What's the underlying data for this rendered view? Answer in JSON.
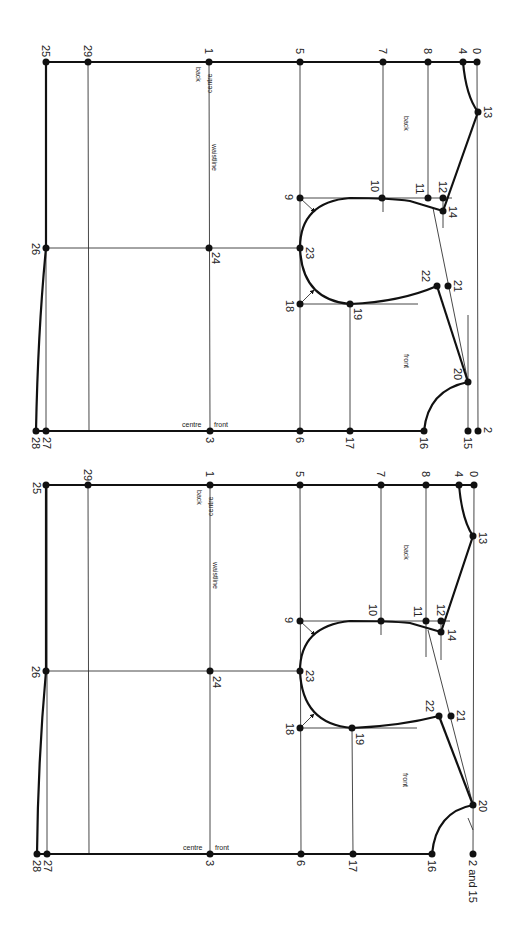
{
  "figure": {
    "panels": [
      {
        "id": "draft-1",
        "labels": {
          "back": "back",
          "front": "front",
          "waistline": "waistline",
          "centre_back": [
            "centre",
            "back"
          ],
          "centre_front": [
            "centre",
            "front"
          ]
        },
        "points": [
          {
            "n": "25",
            "x": 46,
            "y": 62
          },
          {
            "n": "29",
            "x": 88,
            "y": 62
          },
          {
            "n": "1",
            "x": 209,
            "y": 62
          },
          {
            "n": "5",
            "x": 300,
            "y": 62
          },
          {
            "n": "7",
            "x": 383,
            "y": 62
          },
          {
            "n": "8",
            "x": 428,
            "y": 62
          },
          {
            "n": "4",
            "x": 463,
            "y": 62
          },
          {
            "n": "0",
            "x": 477,
            "y": 62
          },
          {
            "n": "13",
            "x": 478,
            "y": 112
          },
          {
            "n": "9",
            "x": 300,
            "y": 198
          },
          {
            "n": "10",
            "x": 382,
            "y": 198
          },
          {
            "n": "11",
            "x": 428,
            "y": 198
          },
          {
            "n": "12",
            "x": 443,
            "y": 198
          },
          {
            "n": "14",
            "x": 443,
            "y": 211
          },
          {
            "n": "26",
            "x": 46,
            "y": 248
          },
          {
            "n": "24",
            "x": 209,
            "y": 248
          },
          {
            "n": "23",
            "x": 300,
            "y": 248
          },
          {
            "n": "22",
            "x": 437,
            "y": 286
          },
          {
            "n": "21",
            "x": 448,
            "y": 286
          },
          {
            "n": "18",
            "x": 300,
            "y": 304
          },
          {
            "n": "19",
            "x": 350,
            "y": 304
          },
          {
            "n": "20",
            "x": 468,
            "y": 382
          },
          {
            "n": "28",
            "x": 36,
            "y": 431
          },
          {
            "n": "27",
            "x": 46,
            "y": 431
          },
          {
            "n": "3",
            "x": 210,
            "y": 431
          },
          {
            "n": "6",
            "x": 300,
            "y": 431
          },
          {
            "n": "17",
            "x": 350,
            "y": 431
          },
          {
            "n": "16",
            "x": 424,
            "y": 431
          },
          {
            "n": "15",
            "x": 468,
            "y": 431
          },
          {
            "n": "2",
            "x": 478,
            "y": 431
          }
        ]
      },
      {
        "id": "draft-2",
        "labels": {
          "back": "back",
          "front": "front",
          "waistline": "waistline",
          "centre_back": [
            "centre",
            "back"
          ],
          "centre_front": [
            "centre",
            "front"
          ]
        },
        "points": [
          {
            "n": "25",
            "x": 46,
            "y": 485
          },
          {
            "n": "29",
            "x": 88,
            "y": 485
          },
          {
            "n": "1",
            "x": 210,
            "y": 485
          },
          {
            "n": "5",
            "x": 300,
            "y": 485
          },
          {
            "n": "7",
            "x": 381,
            "y": 485
          },
          {
            "n": "8",
            "x": 426,
            "y": 485
          },
          {
            "n": "4",
            "x": 459,
            "y": 485
          },
          {
            "n": "0",
            "x": 474,
            "y": 485
          },
          {
            "n": "13",
            "x": 473,
            "y": 536
          },
          {
            "n": "9",
            "x": 300,
            "y": 621
          },
          {
            "n": "10",
            "x": 381,
            "y": 621
          },
          {
            "n": "11",
            "x": 426,
            "y": 621
          },
          {
            "n": "12",
            "x": 441,
            "y": 621
          },
          {
            "n": "14",
            "x": 441,
            "y": 632
          },
          {
            "n": "26",
            "x": 46,
            "y": 671
          },
          {
            "n": "24",
            "x": 210,
            "y": 671
          },
          {
            "n": "23",
            "x": 300,
            "y": 671
          },
          {
            "n": "22",
            "x": 439,
            "y": 716
          },
          {
            "n": "21",
            "x": 451,
            "y": 716
          },
          {
            "n": "18",
            "x": 300,
            "y": 728
          },
          {
            "n": "19",
            "x": 352,
            "y": 728
          },
          {
            "n": "20",
            "x": 473,
            "y": 805
          },
          {
            "n": "28",
            "x": 37,
            "y": 854
          },
          {
            "n": "27",
            "x": 47,
            "y": 854
          },
          {
            "n": "3",
            "x": 210,
            "y": 854
          },
          {
            "n": "6",
            "x": 301,
            "y": 854
          },
          {
            "n": "17",
            "x": 353,
            "y": 854
          },
          {
            "n": "16",
            "x": 432,
            "y": 854
          },
          {
            "n": "2 and 15",
            "x": 473,
            "y": 854
          }
        ]
      }
    ]
  },
  "text": {
    "p1": {
      "n25": "25",
      "n29": "29",
      "n1": "1",
      "n5": "5",
      "n7": "7",
      "n8": "8",
      "n4": "4",
      "n0": "0",
      "n13": "13",
      "n9": "9",
      "n10": "10",
      "n11": "11",
      "n12": "12",
      "n14": "14",
      "n26": "26",
      "n24": "24",
      "n23": "23",
      "n22": "22",
      "n21": "21",
      "n18": "18",
      "n19": "19",
      "n20": "20",
      "n28": "28",
      "n27": "27",
      "n3": "3",
      "n6": "6",
      "n17": "17",
      "n16": "16",
      "n15": "15",
      "n2": "2",
      "back": "back",
      "front": "front",
      "waistline": "waistline",
      "centre_b": "centre",
      "back_b": "back",
      "centre_f": "centre",
      "front_f": "front"
    },
    "p2": {
      "n25": "25",
      "n29": "29",
      "n1": "1",
      "n5": "5",
      "n7": "7",
      "n8": "8",
      "n4": "4",
      "n0": "0",
      "n13": "13",
      "n9": "9",
      "n10": "10",
      "n11": "11",
      "n12": "12",
      "n14": "14",
      "n26": "26",
      "n24": "24",
      "n23": "23",
      "n22": "22",
      "n21": "21",
      "n18": "18",
      "n19": "19",
      "n20": "20",
      "n28": "28",
      "n27": "27",
      "n3": "3",
      "n6": "6",
      "n17": "17",
      "n16": "16",
      "n215": "2 and 15",
      "back": "back",
      "front": "front",
      "waistline": "waistline",
      "centre_b": "centre",
      "back_b": "back",
      "centre_f": "centre",
      "front_f": "front"
    }
  }
}
